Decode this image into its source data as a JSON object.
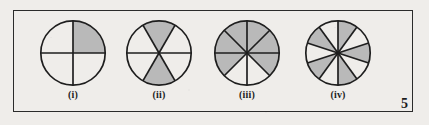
{
  "figure": {
    "page_number": "5",
    "background_color": "#efedea",
    "frame_color": "#2b2b2b",
    "shade_color": "#b9b9b9",
    "line_color": "#1e1e1e",
    "items": [
      {
        "label": "(i)",
        "total_sectors": 4,
        "shaded_sectors": 1,
        "fraction": "1/4",
        "start_angle_deg": 0,
        "shaded_indices": [
          0
        ]
      },
      {
        "label": "(ii)",
        "total_sectors": 6,
        "shaded_sectors": 2,
        "fraction": "2/6",
        "start_angle_deg": 0,
        "shaded_indices": [
          1,
          4
        ]
      },
      {
        "label": "(iii)",
        "total_sectors": 8,
        "shaded_sectors": 6,
        "fraction": "6/8",
        "start_angle_deg": 0,
        "shaded_indices": [
          0,
          1,
          2,
          3,
          4,
          7
        ]
      },
      {
        "label": "(iv)",
        "total_sectors": 10,
        "shaded_sectors": 5,
        "fraction": "5/10",
        "start_angle_deg": 90,
        "shaded_indices": [
          1,
          3,
          5,
          7,
          9
        ]
      }
    ]
  }
}
